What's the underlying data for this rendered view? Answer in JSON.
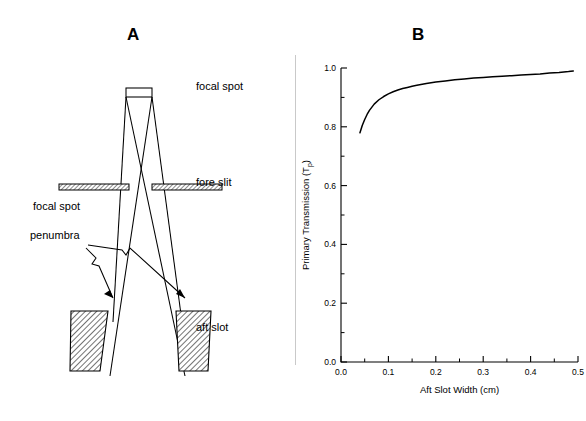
{
  "figure": {
    "panels": [
      {
        "letter": "A",
        "kind": "diagram"
      },
      {
        "letter": "B",
        "kind": "chart"
      }
    ]
  },
  "panel_a": {
    "title": "A",
    "labels": {
      "focal_spot_right": "focal spot",
      "fore_slit": "fore slit",
      "aft_slot": "aft slot",
      "focal_spot_left": "focal spot",
      "penumbra": "penumbra"
    },
    "components": [
      {
        "name": "focal-spot-source",
        "label": "focal spot"
      },
      {
        "name": "fore-slit-collimator",
        "label": "fore slit"
      },
      {
        "name": "aft-slot-collimator",
        "label": "aft slot"
      },
      {
        "name": "penumbra-region",
        "label": "penumbra"
      }
    ]
  },
  "panel_b": {
    "title": "B"
  },
  "chart_data": {
    "type": "line",
    "title": "B",
    "xlabel": "Aft Slot Width (cm)",
    "ylabel": "Primary Transmission (T",
    "ylabel_sub": "p",
    "ylabel_close": ")",
    "xlim": [
      0.0,
      0.5
    ],
    "ylim": [
      0.0,
      1.0
    ],
    "grid": false,
    "legend": null,
    "x_ticks": [
      0.0,
      0.1,
      0.2,
      0.3,
      0.4,
      0.5
    ],
    "x_tick_labels": [
      "0.0",
      "0.1",
      "0.2",
      "0.3",
      "0.4",
      "0.5"
    ],
    "x_minor_ticks": [
      0.05,
      0.15,
      0.25,
      0.35,
      0.45
    ],
    "y_ticks": [
      0.0,
      0.2,
      0.4,
      0.6,
      0.8,
      1.0
    ],
    "y_tick_labels": [
      "0.0",
      "0.2",
      "0.4",
      "0.6",
      "0.8",
      "1.0"
    ],
    "y_minor_ticks": [
      0.1,
      0.3,
      0.5,
      0.7,
      0.9
    ],
    "series": [
      {
        "name": "Primary transmission",
        "color": "#000000",
        "x": [
          0.04,
          0.045,
          0.05,
          0.055,
          0.06,
          0.07,
          0.08,
          0.09,
          0.1,
          0.11,
          0.12,
          0.13,
          0.14,
          0.15,
          0.16,
          0.18,
          0.2,
          0.22,
          0.24,
          0.26,
          0.28,
          0.3,
          0.32,
          0.34,
          0.36,
          0.38,
          0.4,
          0.42,
          0.44,
          0.46,
          0.48,
          0.49
        ],
        "y": [
          0.78,
          0.805,
          0.825,
          0.842,
          0.856,
          0.877,
          0.892,
          0.903,
          0.912,
          0.919,
          0.925,
          0.93,
          0.934,
          0.938,
          0.941,
          0.947,
          0.952,
          0.956,
          0.96,
          0.963,
          0.966,
          0.968,
          0.97,
          0.972,
          0.974,
          0.976,
          0.978,
          0.98,
          0.983,
          0.985,
          0.988,
          0.99
        ]
      }
    ]
  }
}
